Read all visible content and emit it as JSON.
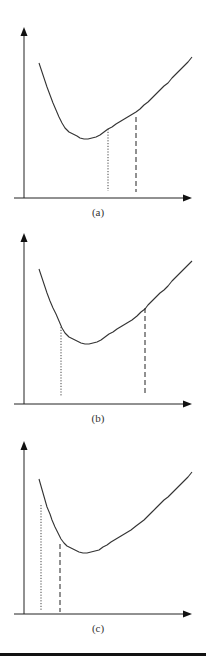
{
  "figure": {
    "panels": [
      {
        "label": "(a)",
        "curve": "u-shaped",
        "markers": [
          {
            "style": "dotted",
            "position_on_x": 0.48,
            "note": "right of minimum"
          },
          {
            "style": "dashed",
            "position_on_x": 0.63,
            "note": "right of dotted"
          }
        ]
      },
      {
        "label": "(b)",
        "curve": "u-shaped",
        "markers": [
          {
            "style": "dotted",
            "position_on_x": 0.22,
            "note": "left of minimum"
          },
          {
            "style": "dashed",
            "position_on_x": 0.71,
            "note": "right of minimum"
          }
        ]
      },
      {
        "label": "(c)",
        "curve": "u-shaped",
        "markers": [
          {
            "style": "dotted",
            "position_on_x": 0.1,
            "note": "far left"
          },
          {
            "style": "dashed",
            "position_on_x": 0.21,
            "note": "left of minimum"
          }
        ]
      }
    ]
  }
}
